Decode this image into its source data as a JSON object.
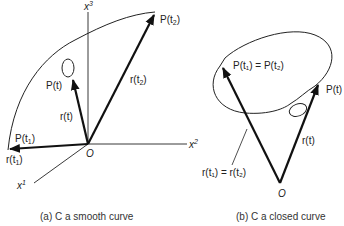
{
  "figure_a": {
    "caption": "(a) C a smooth curve",
    "axes": {
      "x1": "x",
      "x1_sup": "1",
      "x2": "x",
      "x2_sup": "2",
      "x3": "x",
      "x3_sup": "3"
    },
    "origin": "O",
    "labels": {
      "P_t2": "P(t",
      "P_t2_sub": "2",
      "r_t2": "r(t",
      "r_t2_sub": "2",
      "P_t": "P(t)",
      "r_t": "r(t)",
      "P_t1": "P(t",
      "P_t1_sub": "1",
      "r_t1": "r(t",
      "r_t1_sub": "1",
      "close_paren": ")"
    }
  },
  "figure_b": {
    "caption": "(b) C a closed curve",
    "origin": "O",
    "labels": {
      "P_eq": "P(t₁) = P(t₂)",
      "P_t": "P(t)",
      "r_t": "r(t)",
      "r_eq": "r(t₁) = r(t₂)"
    }
  }
}
